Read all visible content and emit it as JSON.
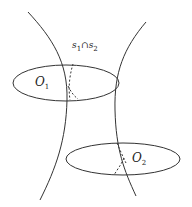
{
  "diagram": {
    "labels": {
      "o1": {
        "base": "O",
        "sub": "1"
      },
      "o2": {
        "base": "O",
        "sub": "2"
      },
      "intersection": {
        "s1": "s",
        "s1_sub": "1",
        "cap": "∩",
        "s2": "s",
        "s2_sub": "2"
      }
    },
    "colors": {
      "stroke": "#333333",
      "background": "#ffffff"
    }
  }
}
